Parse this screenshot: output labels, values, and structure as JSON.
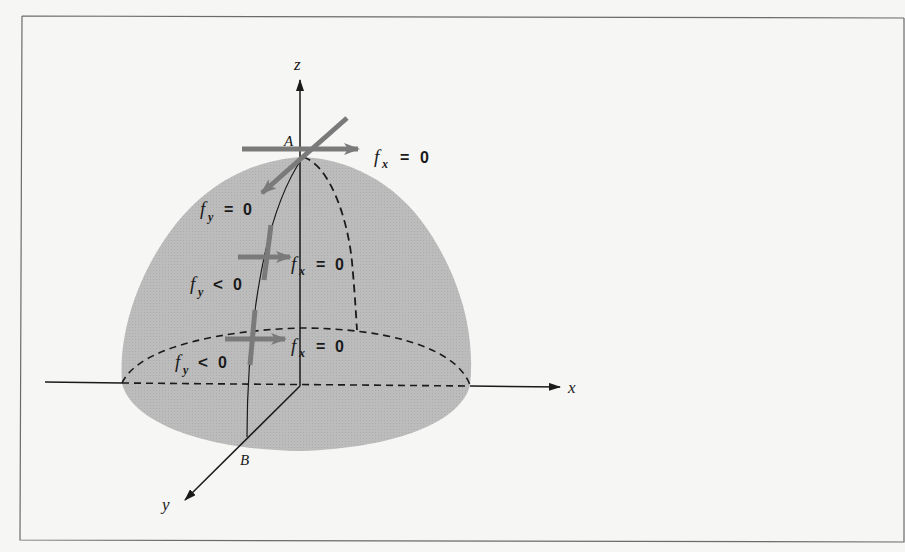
{
  "figure": {
    "frame": {
      "x": 22,
      "y": 16,
      "width": 882,
      "height": 524
    },
    "colors": {
      "background": "#f6f6f4",
      "frame": "#6b6b6b",
      "surface": "#b9b9b9",
      "arrow": "#7a7a7a",
      "line": "#1a1a1a"
    },
    "axes": {
      "z_label": "z",
      "x_label": "x",
      "y_label": "y"
    },
    "points": {
      "A": "A",
      "B": "B"
    },
    "annotations": {
      "top_fx": {
        "f": "f",
        "sub": "x",
        "rel": "=",
        "val": "0"
      },
      "mid_fx": {
        "f": "f",
        "sub": "x",
        "rel": "=",
        "val": "0"
      },
      "low_fx": {
        "f": "f",
        "sub": "x",
        "rel": "=",
        "val": "0"
      },
      "upper_fy": {
        "f": "f",
        "sub": "y",
        "rel": "=",
        "val": "0"
      },
      "mid_fy": {
        "f": "f",
        "sub": "y",
        "rel": "<",
        "val": "0"
      },
      "low_fy": {
        "f": "f",
        "sub": "y",
        "rel": "<",
        "val": "0"
      }
    }
  }
}
